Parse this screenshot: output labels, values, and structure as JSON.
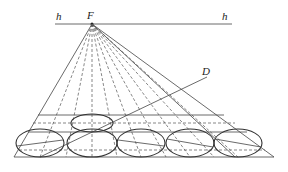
{
  "diagram": {
    "labels": {
      "horizon_left": "h",
      "horizon_right": "h",
      "vanishing_point": "F",
      "diagonal_point": "D"
    },
    "horizon": {
      "y": 24,
      "x1": 55,
      "x2": 232
    },
    "vanishing_point": {
      "x": 92,
      "y": 24
    },
    "diagonal_end": {
      "x": 207,
      "y": 77
    },
    "base": {
      "y": 157,
      "x1": 14,
      "x2": 274
    },
    "horizontal_lines_y": [
      115,
      123,
      132,
      150
    ],
    "top_ellipse": {
      "cx": 92,
      "cy": 123,
      "rx": 21,
      "ry": 9
    },
    "bottom_ellipses": [
      {
        "cx": 40,
        "cy": 143,
        "rx": 24,
        "ry": 14
      },
      {
        "cx": 92,
        "cy": 143,
        "rx": 25,
        "ry": 14
      },
      {
        "cx": 141,
        "cy": 143,
        "rx": 24,
        "ry": 14
      },
      {
        "cx": 190,
        "cy": 143,
        "rx": 24,
        "ry": 14
      },
      {
        "cx": 238,
        "cy": 143,
        "rx": 24,
        "ry": 14
      }
    ]
  }
}
